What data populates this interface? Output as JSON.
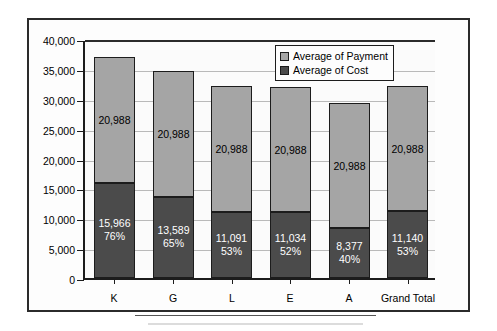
{
  "chart_data": {
    "type": "bar",
    "subtype": "stacked",
    "title": "",
    "xlabel": "",
    "ylabel": "",
    "categories": [
      "K",
      "G",
      "L",
      "E",
      "A",
      "Grand Total"
    ],
    "ylim": [
      0,
      40000
    ],
    "ytick_values": [
      0,
      5000,
      10000,
      15000,
      20000,
      25000,
      30000,
      35000,
      40000
    ],
    "ytick_labels": [
      "0",
      "5,000",
      "10,000",
      "15,000",
      "20,000",
      "25,000",
      "30,000",
      "35,000",
      "40,000"
    ],
    "grid": true,
    "legend_position": "top-right",
    "series": [
      {
        "name": "Average of Cost",
        "color": "#4b4b4b",
        "values": [
          15966,
          13589,
          11091,
          11034,
          8377,
          11140
        ],
        "labels": [
          "15,966",
          "13,589",
          "11,091",
          "11,034",
          "8,377",
          "11,140"
        ],
        "percent_labels": [
          "76%",
          "65%",
          "53%",
          "52%",
          "40%",
          "53%"
        ]
      },
      {
        "name": "Average of Payment",
        "color": "#a5a5a5",
        "values": [
          20988,
          20988,
          20988,
          20988,
          20988,
          20988
        ],
        "labels": [
          "20,988",
          "20,988",
          "20,988",
          "20,988",
          "20,988",
          "20,988"
        ]
      }
    ],
    "totals": [
      36954,
      34577,
      32079,
      32022,
      29365,
      32128
    ]
  },
  "legend": {
    "items": [
      {
        "label": "Average of Payment",
        "color": "#a5a5a5"
      },
      {
        "label": "Average of Cost",
        "color": "#4b4b4b"
      }
    ]
  }
}
